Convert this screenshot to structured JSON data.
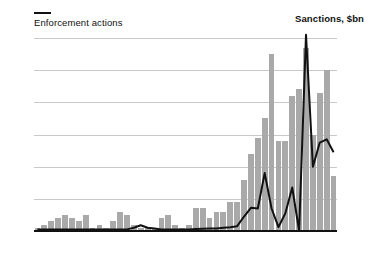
{
  "titles": {
    "left_axis_title": "Enforcement actions",
    "right_axis_title": "Sanctions, $bn"
  },
  "chart_data": {
    "type": "bar",
    "title": "Enforcement actions",
    "subtitle": "Sanctions, $bn",
    "xlabel": "",
    "ylabel": "Enforcement actions",
    "y2label": "Sanctions, $bn",
    "ylim": [
      0,
      60
    ],
    "y2lim": [
      0,
      6
    ],
    "grid": true,
    "legend": "none",
    "yticks": [
      0,
      10,
      20,
      30,
      40,
      50,
      60
    ],
    "y2ticks": [
      0,
      1,
      2,
      3,
      4,
      5,
      6
    ],
    "xticks": [
      "1977",
      "1985",
      "1990",
      "1995",
      "2000",
      "2005",
      "2010",
      "2015",
      "2020†"
    ],
    "xtick_years": [
      1977,
      1985,
      1990,
      1995,
      2000,
      2005,
      2010,
      2015,
      2020
    ],
    "x": [
      1977,
      1978,
      1979,
      1980,
      1981,
      1982,
      1983,
      1984,
      1985,
      1986,
      1987,
      1988,
      1989,
      1990,
      1991,
      1992,
      1993,
      1994,
      1995,
      1996,
      1997,
      1998,
      1999,
      2000,
      2001,
      2002,
      2003,
      2004,
      2005,
      2006,
      2007,
      2008,
      2009,
      2010,
      2011,
      2012,
      2013,
      2014,
      2015,
      2016,
      2017,
      2018,
      2019,
      2020
    ],
    "series": [
      {
        "name": "Enforcement actions",
        "type": "bar",
        "axis": "left",
        "color": "#a9a9a9",
        "values": [
          1,
          2,
          3,
          4,
          5,
          4,
          3,
          5,
          1,
          2,
          1,
          3,
          6,
          5,
          2,
          1,
          1,
          1,
          4,
          5,
          2,
          1,
          2,
          7,
          7,
          4,
          6,
          6,
          9,
          9,
          16,
          24,
          29,
          35,
          55,
          28,
          28,
          42,
          44,
          57,
          30,
          43,
          50,
          17
        ]
      },
      {
        "name": "Sanctions, $bn",
        "type": "line",
        "axis": "right",
        "color": "#111111",
        "values": [
          0.05,
          0.05,
          0.05,
          0.05,
          0.05,
          0.05,
          0.05,
          0.05,
          0.05,
          0.05,
          0.05,
          0.05,
          0.05,
          0.05,
          0.1,
          0.18,
          0.1,
          0.08,
          0.05,
          0.05,
          0.05,
          0.05,
          0.05,
          0.06,
          0.07,
          0.08,
          0.08,
          0.1,
          0.12,
          0.15,
          0.45,
          0.72,
          0.7,
          1.8,
          0.7,
          0.12,
          0.55,
          1.35,
          0.0,
          6.1,
          2.0,
          2.75,
          2.85,
          2.45
        ]
      }
    ]
  }
}
